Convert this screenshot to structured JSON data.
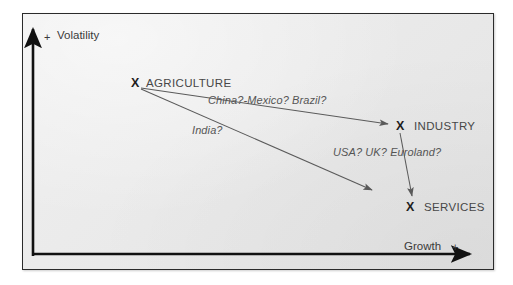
{
  "diagram": {
    "background_color": "#ececec",
    "frame_color": "#2b2b2b",
    "axis_color": "#111111",
    "arrow_color": "#5a5a5a",
    "axes": {
      "y": {
        "plus_sign": "+",
        "label": "Volatility"
      },
      "x": {
        "label": "Growth",
        "plus_sign": "+"
      }
    },
    "nodes": [
      {
        "id": "agriculture",
        "marker": "X",
        "label": "AGRICULTURE"
      },
      {
        "id": "industry",
        "marker": "X",
        "label": "INDUSTRY"
      },
      {
        "id": "services",
        "marker": "X",
        "label": "SERVICES"
      }
    ],
    "edges": [
      {
        "id": "agriculture-to-industry",
        "label": "China?-Mexico? Brazil?"
      },
      {
        "id": "agriculture-to-services-path",
        "label": "India?"
      },
      {
        "id": "industry-to-services",
        "label": "USA? UK? Euroland?"
      }
    ]
  }
}
